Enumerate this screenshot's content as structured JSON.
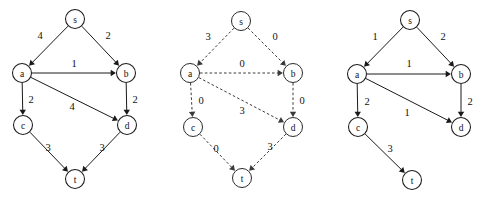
{
  "figure": {
    "title": "",
    "background_color": "#ffffff",
    "ink_color": "#1a1a1a",
    "width": 483,
    "height": 201,
    "panel_count": 3
  },
  "panels": [
    {
      "id": "panel-left",
      "name": "original-weighted-graph",
      "line_style": "solid",
      "nodes": [
        {
          "id": "s",
          "label": "s",
          "x": 75,
          "y": 19,
          "r": 9.5
        },
        {
          "id": "a",
          "label": "a",
          "x": 22,
          "y": 73,
          "r": 9.5
        },
        {
          "id": "b",
          "label": "b",
          "x": 126,
          "y": 73,
          "r": 9.5
        },
        {
          "id": "c",
          "label": "c",
          "x": 23,
          "y": 125,
          "r": 9.5
        },
        {
          "id": "d",
          "label": "d",
          "x": 127,
          "y": 125,
          "r": 9.5
        },
        {
          "id": "t",
          "label": "t",
          "x": 75,
          "y": 179,
          "r": 9.5
        }
      ],
      "edges": [
        {
          "from": "s",
          "to": "a",
          "weight": "4",
          "lx": 40,
          "ly": 35
        },
        {
          "from": "s",
          "to": "b",
          "weight": "2",
          "lx": 108,
          "ly": 35
        },
        {
          "from": "a",
          "to": "b",
          "weight": "1",
          "lx": 74,
          "ly": 63
        },
        {
          "from": "a",
          "to": "c",
          "weight": "2",
          "lx": 31,
          "ly": 99
        },
        {
          "from": "a",
          "to": "d",
          "weight": "4",
          "lx": 72,
          "ly": 106
        },
        {
          "from": "b",
          "to": "d",
          "weight": "2",
          "lx": 135,
          "ly": 99
        },
        {
          "from": "c",
          "to": "t",
          "weight": "3",
          "lx": 48,
          "ly": 147
        },
        {
          "from": "d",
          "to": "t",
          "weight": "3",
          "lx": 102,
          "ly": 147
        }
      ]
    },
    {
      "id": "panel-middle",
      "name": "reweighted-graph-dashed",
      "line_style": "dashed",
      "nodes": [
        {
          "id": "s",
          "label": "s",
          "x": 241,
          "y": 21,
          "r": 9.5
        },
        {
          "id": "a",
          "label": "a",
          "x": 190,
          "y": 73,
          "r": 9.5
        },
        {
          "id": "b",
          "label": "b",
          "x": 293,
          "y": 73,
          "r": 9.5
        },
        {
          "id": "c",
          "label": "c",
          "x": 193,
          "y": 127,
          "r": 9.5
        },
        {
          "id": "d",
          "label": "d",
          "x": 293,
          "y": 127,
          "r": 9.5
        },
        {
          "id": "t",
          "label": "t",
          "x": 242,
          "y": 178,
          "r": 9.5
        }
      ],
      "edges": [
        {
          "from": "s",
          "to": "a",
          "weight": "3",
          "lx": 208,
          "ly": 36
        },
        {
          "from": "s",
          "to": "b",
          "weight": "0",
          "lx": 275,
          "ly": 36
        },
        {
          "from": "a",
          "to": "b",
          "weight": "0",
          "lx": 242,
          "ly": 63
        },
        {
          "from": "a",
          "to": "c",
          "weight": "0",
          "lx": 201,
          "ly": 100
        },
        {
          "from": "a",
          "to": "d",
          "weight": "3",
          "lx": 242,
          "ly": 110
        },
        {
          "from": "b",
          "to": "d",
          "weight": "0",
          "lx": 302,
          "ly": 100
        },
        {
          "from": "c",
          "to": "t",
          "weight": "0",
          "lx": 216,
          "ly": 148
        },
        {
          "from": "d",
          "to": "t",
          "weight": "3",
          "lx": 270,
          "ly": 146
        }
      ]
    },
    {
      "id": "panel-right",
      "name": "shortest-path-tree-graph",
      "line_style": "solid",
      "nodes": [
        {
          "id": "s",
          "label": "s",
          "x": 410,
          "y": 20,
          "r": 9.5
        },
        {
          "id": "a",
          "label": "a",
          "x": 357,
          "y": 74,
          "r": 9.5
        },
        {
          "id": "b",
          "label": "b",
          "x": 461,
          "y": 74,
          "r": 9.5
        },
        {
          "id": "c",
          "label": "c",
          "x": 358,
          "y": 127,
          "r": 9.5
        },
        {
          "id": "d",
          "label": "d",
          "x": 461,
          "y": 127,
          "r": 9.5
        },
        {
          "id": "t",
          "label": "t",
          "x": 412,
          "y": 180,
          "r": 9.5
        }
      ],
      "edges": [
        {
          "from": "s",
          "to": "a",
          "weight": "1",
          "lx": 375,
          "ly": 36
        },
        {
          "from": "s",
          "to": "b",
          "weight": "2",
          "lx": 443,
          "ly": 36
        },
        {
          "from": "a",
          "to": "b",
          "weight": "1",
          "lx": 409,
          "ly": 63
        },
        {
          "from": "a",
          "to": "c",
          "weight": "2",
          "lx": 367,
          "ly": 101
        },
        {
          "from": "a",
          "to": "d",
          "weight": "1",
          "lx": 407,
          "ly": 112
        },
        {
          "from": "b",
          "to": "d",
          "weight": "2",
          "lx": 470,
          "ly": 101
        },
        {
          "from": "c",
          "to": "t",
          "weight": "3",
          "lx": 390,
          "ly": 148
        }
      ]
    }
  ]
}
